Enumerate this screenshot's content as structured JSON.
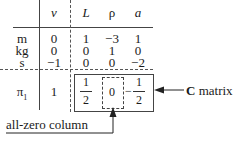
{
  "table": {
    "columns": [
      "ν",
      "L",
      "ρ",
      "a"
    ],
    "rows": [
      {
        "label": "m",
        "values": [
          "0",
          "1",
          "−3",
          "1"
        ]
      },
      {
        "label": "kg",
        "values": [
          "0",
          "0",
          "1",
          "0"
        ]
      },
      {
        "label": "s",
        "values": [
          "−1",
          "0",
          "0",
          "−2"
        ]
      }
    ],
    "pi_row": {
      "label": "π",
      "subscript": "1",
      "nu_value": "1",
      "c_values": [
        {
          "numerator": "1",
          "denominator": "2",
          "sign": ""
        },
        {
          "value": "0"
        },
        {
          "numerator": "1",
          "denominator": "2",
          "sign": "−"
        }
      ]
    }
  },
  "annotations": {
    "c_matrix_bold": "C",
    "c_matrix_rest": " matrix",
    "zero_column": "all-zero column"
  },
  "colors": {
    "line": "#444444",
    "text": "#1a1a1a"
  }
}
